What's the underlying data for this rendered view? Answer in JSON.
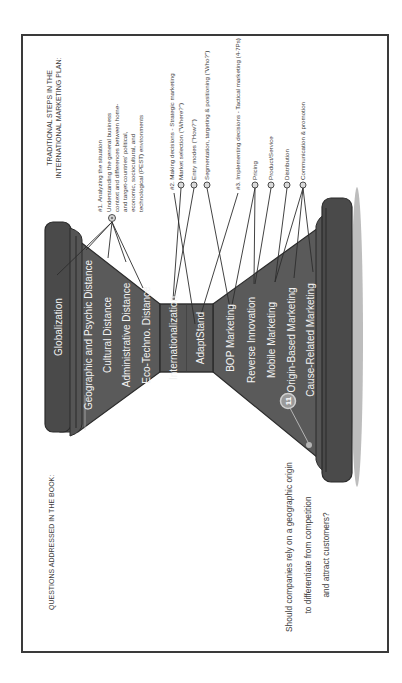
{
  "diagram": {
    "orientation": "rotated-90-ccw",
    "left_heading": "QUESTIONS ADDRESSED IN THE BOOK:",
    "right_heading": {
      "line1": "TRADITIONAL STEPS IN THE",
      "line2": "INTERNATIONAL MARKETING PLAN:"
    },
    "hourglass": {
      "top_cap": "Globalization",
      "top_funnel": [
        "Geographic and Psychic Distance",
        "Cultural Distance",
        "Administrative Distance",
        "Eco-Techno. Distance"
      ],
      "middle": [
        "Internationalization",
        "AdaptStand"
      ],
      "bottom_funnel": [
        "BOP Marketing",
        "Reverse Innovation",
        "Mobile Marketing",
        "Origin-Based Marketing",
        "Cause-Related Marketing"
      ]
    },
    "steps": {
      "step1": {
        "title": "#1. Analyzing the situation",
        "lines": [
          "Understanding the general business",
          "context and differences between home-",
          "and target-countries' political,",
          "economic, sociocultural, and",
          "technological (PEST) environments"
        ]
      },
      "step2": {
        "title": "#2. Making decisions - Strategic marketing",
        "items": [
          "Market selection (\"Where?\")",
          "Entry modes (\"How?\")",
          "Segmentation, targeting & positioning (\"Who?\")"
        ]
      },
      "step3": {
        "title": "#3. Implementing decisions - Tactical marketing (4-7Ps)",
        "items": [
          "Pricing",
          "Product/Service",
          "Distribution",
          "Communication & promotion"
        ]
      }
    },
    "badge": "11",
    "question": {
      "line1": "Should companies rely on a geographic origin",
      "line2": "to differentiate from competition",
      "line3": "and attract customers?"
    },
    "colors": {
      "shape_fill": "#5a5a5a",
      "shape_dark": "#4a4a4a",
      "outline": "#2b2b2b",
      "text_on_shape": "#f2f2f2",
      "text": "#3c3c3c",
      "shadow": "#bdbdbd",
      "badge": "#9a9a9a"
    }
  }
}
